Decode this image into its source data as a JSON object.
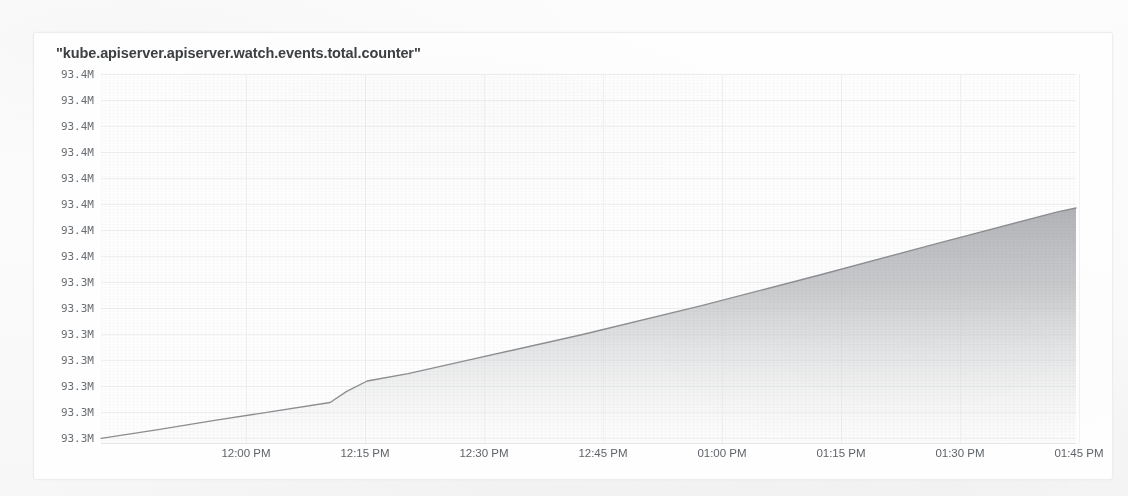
{
  "chart_data": {
    "type": "area",
    "title": "\"kube.apiserver.apiserver.watch.events.total.counter\"",
    "xlabel": "",
    "ylabel": "",
    "grid": true,
    "legend_position": "none",
    "x_tick_labels": [
      "12:00 PM",
      "12:15 PM",
      "12:30 PM",
      "12:45 PM",
      "01:00 PM",
      "01:15 PM",
      "01:30 PM",
      "01:45 PM"
    ],
    "y_tick_labels": [
      "93.4M",
      "93.4M",
      "93.4M",
      "93.4M",
      "93.4M",
      "93.4M",
      "93.4M",
      "93.4M",
      "93.3M",
      "93.3M",
      "93.3M",
      "93.3M",
      "93.3M",
      "93.3M",
      "93.3M"
    ],
    "y_tick_values": [
      93449000,
      93441000,
      93433000,
      93425000,
      93417000,
      93409000,
      93401000,
      93393000,
      93385000,
      93377000,
      93369000,
      93361000,
      93353000,
      93345000,
      93337000
    ],
    "ylim": [
      93333000,
      93453000
    ],
    "xlim": [
      "11:46 PM",
      "01:47 PM"
    ],
    "series": [
      {
        "name": "kube.apiserver.apiserver.watch.events.total.counter",
        "line_color": "#8d8f92",
        "fill_color": "#b9bbbe",
        "points": [
          {
            "t": "11:46 AM",
            "x": 0.0,
            "y": 93337000
          },
          {
            "t": "11:53 AM",
            "x": 0.057,
            "y": 93339600
          },
          {
            "t": "12:00 PM",
            "x": 0.115,
            "y": 93342400
          },
          {
            "t": "12:08 PM",
            "x": 0.175,
            "y": 93345200
          },
          {
            "t": "12:14 PM",
            "x": 0.235,
            "y": 93348000
          },
          {
            "t": "12:16 PM",
            "x": 0.252,
            "y": 93351400
          },
          {
            "t": "12:18 PM",
            "x": 0.273,
            "y": 93354600
          },
          {
            "t": "12:23 PM",
            "x": 0.315,
            "y": 93356900
          },
          {
            "t": "12:30 PM",
            "x": 0.372,
            "y": 93360700
          },
          {
            "t": "12:45 PM",
            "x": 0.494,
            "y": 93368900
          },
          {
            "t": "01:00 PM",
            "x": 0.616,
            "y": 93377800
          },
          {
            "t": "01:15 PM",
            "x": 0.737,
            "y": 93387200
          },
          {
            "t": "01:30 PM",
            "x": 0.859,
            "y": 93397000
          },
          {
            "t": "01:45 PM",
            "x": 0.981,
            "y": 93406600
          },
          {
            "t": "01:47 PM",
            "x": 1.0,
            "y": 93407800
          }
        ]
      }
    ]
  }
}
